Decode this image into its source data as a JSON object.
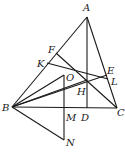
{
  "diagram": {
    "type": "geometry",
    "points": {
      "A": [
        87,
        17
      ],
      "B": [
        12,
        107
      ],
      "C": [
        117,
        108
      ],
      "D": [
        87,
        108
      ],
      "F": [
        56,
        53
      ],
      "K": [
        47,
        63
      ],
      "E": [
        107,
        75
      ],
      "L": [
        108,
        79
      ],
      "O": [
        64,
        75
      ],
      "H": [
        87,
        80
      ],
      "M": [
        64,
        108
      ],
      "N": [
        64,
        140
      ]
    },
    "segments": [
      [
        "A",
        "B"
      ],
      [
        "A",
        "C"
      ],
      [
        "B",
        "C"
      ],
      [
        "A",
        "D"
      ],
      [
        "F",
        "C"
      ],
      [
        "K",
        "L"
      ],
      [
        "B",
        "E"
      ],
      [
        "B",
        "O"
      ],
      [
        "O",
        "N"
      ],
      [
        "B",
        "N"
      ],
      [
        "B",
        "H"
      ]
    ],
    "labels": [
      {
        "text": "A",
        "x": 83,
        "y": 11
      },
      {
        "text": "B",
        "x": 2,
        "y": 111
      },
      {
        "text": "C",
        "x": 117,
        "y": 116
      },
      {
        "text": "D",
        "x": 81,
        "y": 121
      },
      {
        "text": "F",
        "x": 48,
        "y": 53
      },
      {
        "text": "K",
        "x": 37,
        "y": 67
      },
      {
        "text": "E",
        "x": 107,
        "y": 74
      },
      {
        "text": "L",
        "x": 111,
        "y": 85
      },
      {
        "text": "O",
        "x": 66,
        "y": 81
      },
      {
        "text": "H",
        "x": 77,
        "y": 95
      },
      {
        "text": "M",
        "x": 66,
        "y": 121
      },
      {
        "text": "N",
        "x": 66,
        "y": 146
      }
    ]
  }
}
